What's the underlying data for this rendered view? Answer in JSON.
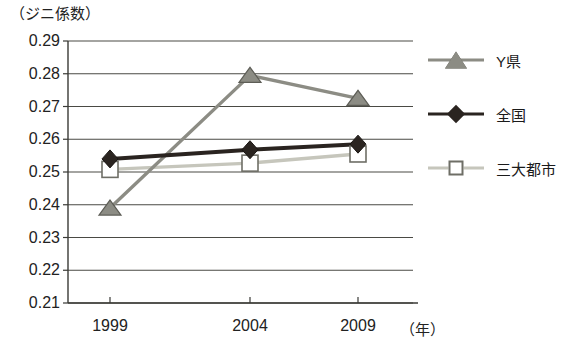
{
  "chart_data": {
    "type": "line",
    "title": "",
    "ylabel": "（ジニ係数）",
    "xlabel": "（年）",
    "categories": [
      "1999",
      "2004",
      "2009"
    ],
    "x": [
      1999,
      2004,
      2009
    ],
    "ylim": [
      0.21,
      0.29
    ],
    "yticks": [
      "0.29",
      "0.28",
      "0.27",
      "0.26",
      "0.25",
      "0.24",
      "0.23",
      "0.22",
      "0.21"
    ],
    "ytick_values": [
      0.29,
      0.28,
      0.27,
      0.26,
      0.25,
      0.24,
      0.23,
      0.22,
      0.21
    ],
    "grid": true,
    "legend_position": "right",
    "series": [
      {
        "name": "Y県",
        "marker": "triangle",
        "color": "#8c8c84",
        "marker_fill": "#8c8c84",
        "values": [
          0.239,
          0.2795,
          0.2725
        ]
      },
      {
        "name": "全国",
        "marker": "diamond",
        "color": "#2a2420",
        "marker_fill": "#2a2420",
        "values": [
          0.254,
          0.2568,
          0.2585
        ]
      },
      {
        "name": "三大都市",
        "marker": "square",
        "color": "#c6c6bc",
        "marker_fill": "#ffffff",
        "values": [
          0.2508,
          0.2527,
          0.2555
        ]
      }
    ]
  },
  "axes": {
    "unit_label": "（年）",
    "y_axis_caption": "（ジニ係数）"
  },
  "legend": {
    "items": [
      {
        "label": "Y県"
      },
      {
        "label": "全国"
      },
      {
        "label": "三大都市"
      }
    ]
  },
  "colors": {
    "axis": "#3a3a36",
    "grid": "#4a4a44",
    "series_y_ken": "#8c8c84",
    "series_zenkoku": "#2a2420",
    "series_sandaitoshi": "#c6c6bc",
    "background": "#ffffff"
  }
}
